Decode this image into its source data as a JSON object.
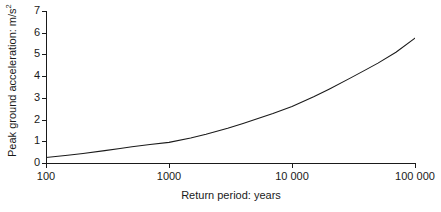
{
  "chart_data": {
    "type": "line",
    "title": "",
    "subtitle": "",
    "xlabel": "Return period: years",
    "ylabel": "Peak ground acceleration: m/s²",
    "ylabel_text": "Peak ground acceleration: m/s",
    "ylabel_exponent": "2",
    "xscale": "log",
    "yscale": "linear",
    "xlim": [
      100,
      100000
    ],
    "ylim": [
      0,
      7
    ],
    "grid": false,
    "legend": null,
    "legend_position": "none",
    "line_color": "#1a1a1a",
    "axis_color": "#1a1a1a",
    "background_color": "#ffffff",
    "xticks": [
      100,
      1000,
      10000,
      100000
    ],
    "xtick_labels": [
      "100",
      "1000",
      "10 000",
      "100 000"
    ],
    "yticks": [
      0,
      1,
      2,
      3,
      4,
      5,
      6,
      7
    ],
    "ytick_labels": [
      "0",
      "1",
      "2",
      "3",
      "4",
      "5",
      "6",
      "7"
    ],
    "series": [
      {
        "name": "Peak ground acceleration",
        "x": [
          100,
          150,
          200,
          300,
          400,
          500,
          700,
          1000,
          1500,
          2000,
          3000,
          4000,
          5000,
          7000,
          10000,
          15000,
          20000,
          30000,
          40000,
          50000,
          70000,
          100000
        ],
        "values": [
          0.25,
          0.36,
          0.44,
          0.57,
          0.67,
          0.75,
          0.85,
          0.95,
          1.15,
          1.32,
          1.6,
          1.82,
          2.0,
          2.28,
          2.6,
          3.05,
          3.4,
          3.92,
          4.3,
          4.6,
          5.1,
          5.75
        ]
      }
    ],
    "annotations": []
  }
}
